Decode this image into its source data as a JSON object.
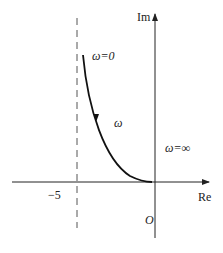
{
  "diagram": {
    "type": "nyquist-plot",
    "axes": {
      "real_label": "Re",
      "imag_label": "Im",
      "origin_label": "O"
    },
    "asymptote": {
      "label": "−5",
      "value": -5,
      "style": "dashed"
    },
    "curve_labels": {
      "start": "ω=0",
      "middle": "ω",
      "end": "ω=∞"
    }
  }
}
